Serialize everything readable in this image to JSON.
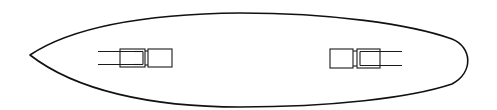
{
  "figure": {
    "view": "top-down outline",
    "colors": {
      "line": "#111111",
      "background": "#ffffff"
    }
  },
  "hull": {
    "bow": "pointed, left",
    "stern": "rounded, right"
  },
  "mounts": [
    {
      "name": "forward-mount",
      "position": "forward",
      "barrels_direction": "left",
      "barrel_count": 2
    },
    {
      "name": "aft-mount",
      "position": "aft",
      "barrels_direction": "right",
      "barrel_count": 2
    }
  ]
}
